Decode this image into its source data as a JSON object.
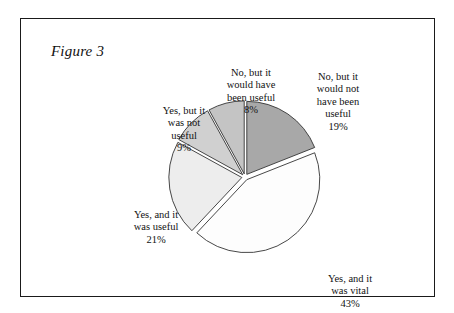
{
  "figure": {
    "caption": "Figure 3"
  },
  "chart_data": {
    "type": "pie",
    "title": "Figure 3",
    "xlabel": "",
    "ylabel": "",
    "legend_position": "none",
    "grid": false,
    "labels_outside": true,
    "exploded": true,
    "start_angle_deg": 0,
    "direction": "clockwise",
    "categories": [
      "No, but it would not have been useful",
      "Yes, and it was vital",
      "Yes, and it was useful",
      "Yes, but it was not useful",
      "No, but it would have been useful"
    ],
    "values": [
      19,
      43,
      21,
      9,
      8
    ],
    "value_labels": [
      "19%",
      "43%",
      "21%",
      "9%",
      "8%"
    ],
    "colors": [
      "#a8a8a8",
      "#fdfdfd",
      "#ededed",
      "#d0d0d0",
      "#c4c4c4"
    ],
    "slice_edge_color": "#333333",
    "slices": [
      {
        "name": "No, but it would not have been useful",
        "value": 19,
        "value_label": "19%",
        "color": "#a8a8a8",
        "label_lines": "No, but it\nwould not\nhave been\nuseful"
      },
      {
        "name": "Yes, and it was vital",
        "value": 43,
        "value_label": "43%",
        "color": "#fdfdfd",
        "label_lines": "Yes, and it\nwas vital"
      },
      {
        "name": "Yes, and it was useful",
        "value": 21,
        "value_label": "21%",
        "color": "#ededed",
        "label_lines": "Yes, and it\nwas useful"
      },
      {
        "name": "Yes, but it was not useful",
        "value": 9,
        "value_label": "9%",
        "color": "#d0d0d0",
        "label_lines": "Yes, but it\nwas not\nuseful"
      },
      {
        "name": "No, but it would have been useful",
        "value": 8,
        "value_label": "8%",
        "color": "#c4c4c4",
        "label_lines": "No, but it\nwould have\nbeen useful"
      }
    ]
  }
}
